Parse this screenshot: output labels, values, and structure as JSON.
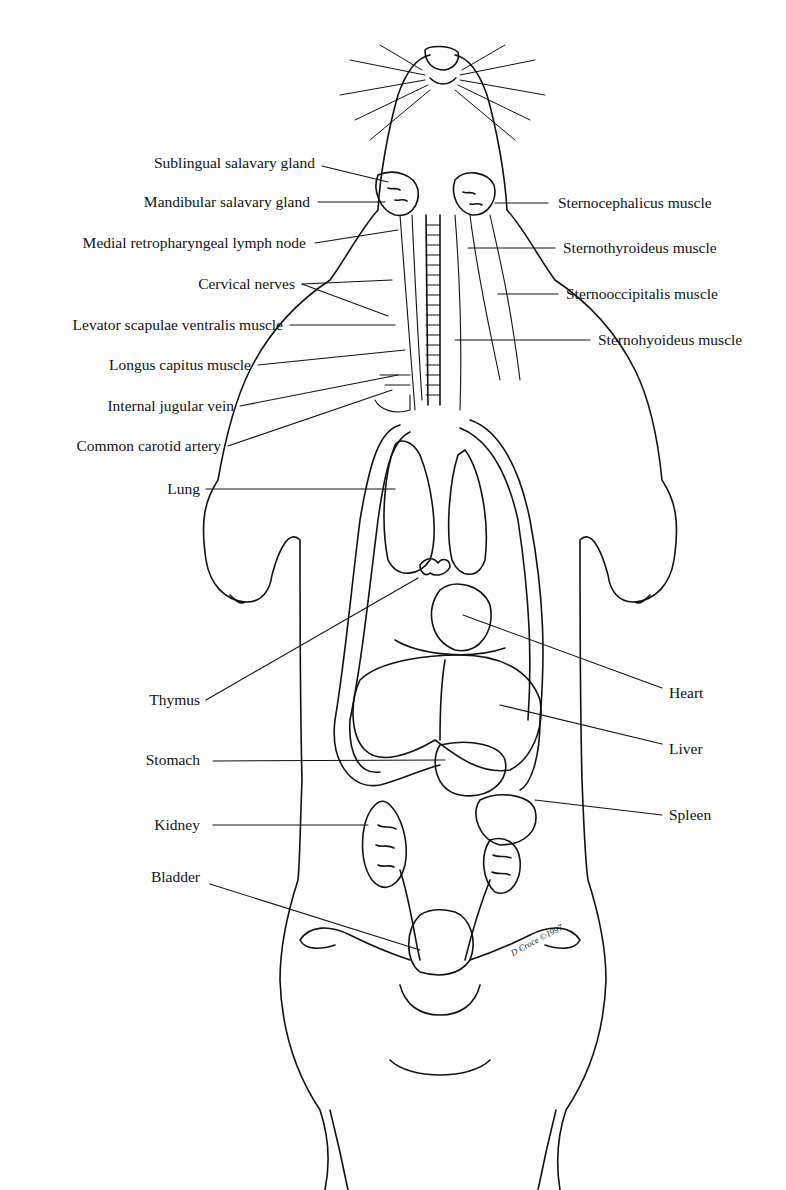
{
  "diagram": {
    "signature": "D Croce ©1997",
    "labels_left": [
      {
        "text": "Sublingual salavary gland",
        "x": 315,
        "y": 163
      },
      {
        "text": "Mandibular salavary gland",
        "x": 310,
        "y": 202
      },
      {
        "text": "Medial retropharyngeal lymph node",
        "x": 306,
        "y": 243
      },
      {
        "text": "Cervical nerves",
        "x": 295,
        "y": 284
      },
      {
        "text": "Levator scapulae ventralis muscle",
        "x": 283,
        "y": 325
      },
      {
        "text": "Longus capitus muscle",
        "x": 251,
        "y": 365
      },
      {
        "text": "Internal jugular vein",
        "x": 234,
        "y": 406
      },
      {
        "text": "Common carotid artery",
        "x": 221,
        "y": 446
      },
      {
        "text": "Lung",
        "x": 200,
        "y": 489
      },
      {
        "text": "Thymus",
        "x": 200,
        "y": 700
      },
      {
        "text": "Stomach",
        "x": 200,
        "y": 760
      },
      {
        "text": "Kidney",
        "x": 200,
        "y": 825
      },
      {
        "text": "Bladder",
        "x": 200,
        "y": 877
      }
    ],
    "labels_right": [
      {
        "text": "Sternocephalicus muscle",
        "x": 558,
        "y": 203
      },
      {
        "text": "Sternothyroideus muscle",
        "x": 563,
        "y": 248
      },
      {
        "text": "Sternooccipitalis muscle",
        "x": 566,
        "y": 294
      },
      {
        "text": "Sternohyoideus muscle",
        "x": 598,
        "y": 340
      },
      {
        "text": "Heart",
        "x": 669,
        "y": 693
      },
      {
        "text": "Liver",
        "x": 669,
        "y": 749
      },
      {
        "text": "Spleen",
        "x": 669,
        "y": 815
      }
    ]
  }
}
